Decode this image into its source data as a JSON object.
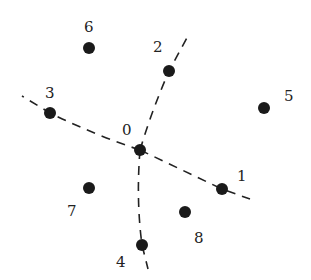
{
  "diagram": {
    "type": "point-partition",
    "colors": {
      "node": "#1a1a1a",
      "edge": "#222222",
      "label": "#222222",
      "background": "#ffffff"
    },
    "nodes": [
      {
        "id": "0",
        "label": "0",
        "x": 140,
        "y": 150,
        "lx": 122,
        "ly": 135
      },
      {
        "id": "1",
        "label": "1",
        "x": 222,
        "y": 189,
        "lx": 237,
        "ly": 181
      },
      {
        "id": "2",
        "label": "2",
        "x": 169,
        "y": 71,
        "lx": 153,
        "ly": 52
      },
      {
        "id": "3",
        "label": "3",
        "x": 50,
        "y": 113,
        "lx": 45,
        "ly": 98
      },
      {
        "id": "4",
        "label": "4",
        "x": 142,
        "y": 245,
        "lx": 116,
        "ly": 267
      },
      {
        "id": "5",
        "label": "5",
        "x": 264,
        "y": 108,
        "lx": 284,
        "ly": 101
      },
      {
        "id": "6",
        "label": "6",
        "x": 89,
        "y": 48,
        "lx": 84,
        "ly": 32
      },
      {
        "id": "7",
        "label": "7",
        "x": 89,
        "y": 188,
        "lx": 67,
        "ly": 216
      },
      {
        "id": "8",
        "label": "8",
        "x": 185,
        "y": 212,
        "lx": 194,
        "ly": 243
      }
    ],
    "edges": [
      {
        "from": "0",
        "to": "3",
        "style": "dashed",
        "path": "M140,150 Q95,135 50,113 L22,96"
      },
      {
        "from": "0",
        "to": "1",
        "style": "dashed",
        "path": "M140,150 L222,189 L250,199"
      },
      {
        "from": "0",
        "to": "2",
        "style": "dashed",
        "path": "M140,150 Q152,110 169,71 L189,34"
      },
      {
        "from": "0",
        "to": "4",
        "style": "dashed",
        "path": "M140,150 Q136,200 142,245 L148,269"
      }
    ]
  }
}
